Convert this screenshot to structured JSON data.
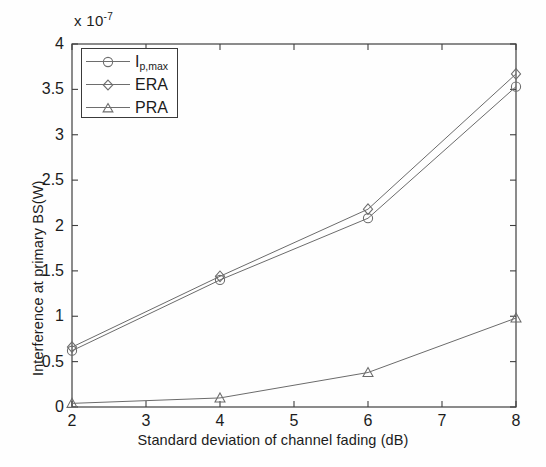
{
  "chart_data": {
    "type": "line",
    "title": "",
    "xlabel": "Standard deviation of channel fading  (dB)",
    "ylabel": "Interference at primary BS(W)",
    "y_multiplier": "x 10",
    "y_multiplier_exponent": "-7",
    "x": [
      2,
      4,
      6,
      8
    ],
    "xlim": [
      2,
      8
    ],
    "ylim": [
      0,
      4
    ],
    "xticks": [
      "2",
      "3",
      "4",
      "5",
      "6",
      "7",
      "8"
    ],
    "xtick_values": [
      2,
      3,
      4,
      5,
      6,
      7,
      8
    ],
    "yticks": [
      "0",
      "0.5",
      "1",
      "1.5",
      "2",
      "2.5",
      "3",
      "3.5",
      "4"
    ],
    "ytick_values": [
      0,
      0.5,
      1,
      1.5,
      2,
      2.5,
      3,
      3.5,
      4
    ],
    "grid": false,
    "legend_position": "upper left",
    "series": [
      {
        "name": "I_p,max",
        "label_main": "I",
        "label_sub": "p,max",
        "marker": "circle",
        "color": "#707070",
        "values": [
          0.62,
          1.4,
          2.08,
          3.53
        ]
      },
      {
        "name": "ERA",
        "label_main": "ERA",
        "label_sub": "",
        "marker": "diamond",
        "color": "#707070",
        "values": [
          0.66,
          1.44,
          2.18,
          3.67
        ]
      },
      {
        "name": "PRA",
        "label_main": "PRA",
        "label_sub": "",
        "marker": "triangle",
        "color": "#707070",
        "values": [
          0.04,
          0.1,
          0.38,
          0.98
        ]
      }
    ]
  },
  "axis": {
    "multiplier_prefix": "x 10",
    "multiplier_exp": "-7"
  }
}
